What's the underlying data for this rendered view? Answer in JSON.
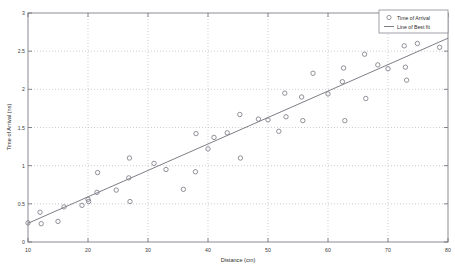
{
  "chart_data": {
    "type": "scatter",
    "title": "",
    "xlabel": "Distance (cm)",
    "ylabel": "Time of Arrival (ns)",
    "xlim": [
      10,
      80
    ],
    "ylim": [
      0,
      3
    ],
    "xticks": [
      10,
      20,
      30,
      40,
      50,
      60,
      70,
      80
    ],
    "yticks": [
      0,
      0.5,
      1,
      1.5,
      2,
      2.5,
      3
    ],
    "xtick_labels": [
      "10",
      "20",
      "30",
      "40",
      "50",
      "60",
      "70",
      "80"
    ],
    "ytick_labels": [
      "0",
      "0.5",
      "1",
      "1.5",
      "2",
      "2.5",
      "3"
    ],
    "grid": true,
    "grid_style": "dotted",
    "legend_position": "top-right",
    "series": [
      {
        "name": "Time of Arrival",
        "type": "scatter",
        "marker": "circle-open",
        "color": "#7d7d88",
        "points": [
          [
            10.0,
            0.25
          ],
          [
            12.0,
            0.39
          ],
          [
            12.2,
            0.24
          ],
          [
            15.0,
            0.27
          ],
          [
            16.0,
            0.46
          ],
          [
            19.0,
            0.48
          ],
          [
            20.0,
            0.56
          ],
          [
            20.1,
            0.53
          ],
          [
            21.5,
            0.65
          ],
          [
            21.6,
            0.91
          ],
          [
            24.7,
            0.68
          ],
          [
            26.8,
            0.84
          ],
          [
            26.9,
            1.1
          ],
          [
            27.0,
            0.53
          ],
          [
            31.0,
            1.03
          ],
          [
            33.0,
            0.95
          ],
          [
            35.9,
            0.69
          ],
          [
            37.9,
            0.92
          ],
          [
            38.0,
            1.42
          ],
          [
            40.0,
            1.22
          ],
          [
            41.0,
            1.37
          ],
          [
            43.2,
            1.43
          ],
          [
            45.3,
            1.67
          ],
          [
            45.4,
            1.1
          ],
          [
            48.4,
            1.61
          ],
          [
            50.0,
            1.6
          ],
          [
            51.8,
            1.45
          ],
          [
            52.8,
            1.95
          ],
          [
            53.0,
            1.64
          ],
          [
            55.6,
            1.9
          ],
          [
            55.8,
            1.59
          ],
          [
            57.5,
            2.21
          ],
          [
            60.0,
            1.94
          ],
          [
            62.4,
            2.1
          ],
          [
            62.6,
            2.28
          ],
          [
            62.8,
            1.59
          ],
          [
            66.1,
            2.46
          ],
          [
            66.3,
            1.88
          ],
          [
            68.3,
            2.32
          ],
          [
            70.0,
            2.27
          ],
          [
            72.7,
            2.57
          ],
          [
            72.9,
            2.29
          ],
          [
            73.1,
            2.12
          ],
          [
            74.9,
            2.6
          ],
          [
            78.6,
            2.55
          ]
        ]
      },
      {
        "name": "Line of Best fit",
        "type": "line",
        "color": "#6e6e78",
        "endpoints": [
          [
            10.0,
            0.245
          ],
          [
            80.0,
            2.67
          ]
        ],
        "slope": 0.0346,
        "intercept": -0.101
      }
    ],
    "legend_entries": [
      {
        "label": "Time of Arrival",
        "marker": "circle-open"
      },
      {
        "label": "Line of Best fit",
        "marker": "line"
      }
    ]
  }
}
